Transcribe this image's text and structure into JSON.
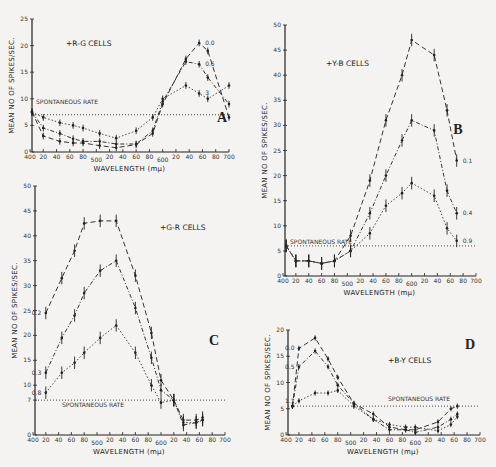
{
  "chart_data": [
    {
      "panel": "A",
      "type": "line",
      "title": "+R-G CELLS",
      "xlabel": "WAVELENGTH (mμ)",
      "ylabel": "MEAN NO OF SPIKES/SEC.",
      "xlim": [
        400,
        700
      ],
      "ylim": [
        0,
        25
      ],
      "yticks": [
        0,
        5,
        10,
        15,
        20,
        25
      ],
      "xtick_labels": [
        "400",
        "20",
        "40",
        "60",
        "80",
        "500",
        "20",
        "40",
        "60",
        "80",
        "600",
        "20",
        "40",
        "60",
        "80",
        "700"
      ],
      "spontaneous_rate": 7,
      "spontaneous_label": "SPONTANEOUS RATE",
      "grid": false,
      "series": [
        {
          "name": "0.0",
          "x": [
            403,
            420,
            445,
            465,
            480,
            505,
            530,
            560,
            585,
            600,
            635,
            655,
            668,
            700
          ],
          "y": [
            7.5,
            3,
            2,
            1.7,
            1.7,
            1.2,
            0.8,
            1.4,
            3.5,
            9,
            17.5,
            20.5,
            19,
            6.5
          ]
        },
        {
          "name": "0.6",
          "x": [
            403,
            420,
            445,
            465,
            480,
            505,
            530,
            560,
            585,
            600,
            635,
            655,
            668,
            700
          ],
          "y": [
            7.5,
            4.5,
            3.5,
            2.5,
            2,
            2,
            1.5,
            1.5,
            4,
            9.5,
            17,
            16.5,
            14,
            9
          ]
        },
        {
          "name": "3",
          "x": [
            403,
            420,
            445,
            465,
            480,
            505,
            530,
            560,
            585,
            600,
            635,
            655,
            668,
            700
          ],
          "y": [
            7.5,
            6.5,
            5.5,
            5,
            4.5,
            3.5,
            2.6,
            4,
            6.5,
            10,
            12.5,
            11,
            10,
            12.5
          ]
        }
      ]
    },
    {
      "panel": "B",
      "type": "line",
      "title": "+Y-B CELLS",
      "xlabel": "WAVELENGTH (mμ)",
      "ylabel": "MEAN NO OF SPIKES/SEC.",
      "xlim": [
        400,
        700
      ],
      "ylim": [
        0,
        50
      ],
      "yticks": [
        0,
        5,
        10,
        15,
        20,
        25,
        30,
        35,
        40,
        45,
        50
      ],
      "xtick_labels": [
        "400",
        "20",
        "40",
        "60",
        "80",
        "500",
        "20",
        "40",
        "60",
        "80",
        "600",
        "20",
        "40",
        "60",
        "80",
        "700"
      ],
      "spontaneous_rate": 6,
      "spontaneous_label": "SPONTANEOUS RATE",
      "grid": false,
      "series": [
        {
          "name": "0.1",
          "x": [
            405,
            420,
            440,
            460,
            480,
            505,
            535,
            560,
            585,
            600,
            635,
            655,
            670
          ],
          "y": [
            6,
            3,
            3,
            2.5,
            3,
            8,
            19,
            31,
            40,
            47,
            44,
            33,
            23
          ]
        },
        {
          "name": "0.4",
          "x": [
            405,
            420,
            440,
            460,
            480,
            505,
            535,
            560,
            585,
            600,
            635,
            655,
            670
          ],
          "y": [
            6,
            3,
            3,
            2.5,
            3,
            5,
            12.5,
            20,
            27,
            31,
            29,
            17,
            12.5
          ]
        },
        {
          "name": "0.9",
          "x": [
            405,
            420,
            440,
            460,
            480,
            505,
            535,
            560,
            585,
            600,
            635,
            655,
            670
          ],
          "y": [
            6,
            3,
            3,
            2.5,
            3,
            5,
            8.5,
            14,
            16.5,
            18.5,
            16,
            9.5,
            7
          ]
        }
      ]
    },
    {
      "panel": "C",
      "type": "line",
      "title": "+G-R CELLS",
      "xlabel": "WAVELENGTH (mμ)",
      "ylabel": "MEAN NO OF SPIKES/SEC.",
      "xlim": [
        400,
        700
      ],
      "ylim": [
        0,
        50
      ],
      "yticks": [
        0,
        7,
        10,
        15,
        20,
        25,
        30,
        35,
        40,
        45,
        50
      ],
      "xtick_labels": [
        "400",
        "20",
        "40",
        "60",
        "80",
        "500",
        "20",
        "40",
        "60",
        "80",
        "600",
        "20",
        "40",
        "60",
        "80",
        "700"
      ],
      "spontaneous_rate": 7,
      "spontaneous_label": "SPONTANEOUS RATE",
      "grid": false,
      "series": [
        {
          "name": "0.2",
          "x": [
            420,
            445,
            465,
            480,
            505,
            530,
            560,
            585,
            600,
            620,
            635,
            655,
            665
          ],
          "y": [
            24.5,
            31.5,
            37,
            42.5,
            43,
            43,
            32,
            20.5,
            11,
            7,
            3,
            3,
            3.5
          ]
        },
        {
          "name": "0.3",
          "x": [
            420,
            445,
            465,
            480,
            505,
            530,
            560,
            585,
            600,
            620,
            635,
            655,
            665
          ],
          "y": [
            12.5,
            19.5,
            24,
            28.5,
            33,
            35,
            25.5,
            15.5,
            9,
            7,
            2,
            2.5,
            3
          ]
        },
        {
          "name": "0.8",
          "x": [
            420,
            445,
            465,
            480,
            505,
            530,
            560,
            585,
            600,
            620,
            635,
            655,
            665
          ],
          "y": [
            8.5,
            12.5,
            14.5,
            16.5,
            19.5,
            22,
            16.5,
            10,
            6.5,
            7,
            2.5,
            2.5,
            3
          ]
        }
      ]
    },
    {
      "panel": "D",
      "type": "line",
      "title": "+B-Y CELLS",
      "xlabel": "WAVELENGTH (mμ)",
      "ylabel": "MEAN NO OF SPIKES/SEC.",
      "xlim": [
        400,
        700
      ],
      "ylim": [
        0,
        20
      ],
      "yticks": [
        0,
        5,
        10,
        15,
        20
      ],
      "xtick_labels": [
        "400",
        "20",
        "40",
        "60",
        "80",
        "500",
        "20",
        "40",
        "60",
        "80",
        "600",
        "20",
        "40",
        "60",
        "80",
        "700"
      ],
      "spontaneous_rate": 5.5,
      "spontaneous_label": "SPONTANEOUS RATE",
      "grid": false,
      "series": [
        {
          "name": "0.0",
          "x": [
            410,
            420,
            445,
            465,
            480,
            505,
            535,
            560,
            585,
            600,
            635,
            655,
            665
          ],
          "y": [
            5.5,
            16.5,
            18.5,
            14.5,
            11,
            6,
            4,
            1.5,
            1,
            1,
            2.5,
            5,
            5.5
          ]
        },
        {
          "name": "0.5",
          "x": [
            410,
            420,
            445,
            465,
            480,
            505,
            535,
            560,
            585,
            600,
            635,
            655,
            665
          ],
          "y": [
            5.5,
            13,
            16,
            13,
            9.5,
            6,
            3,
            1,
            1,
            0.5,
            1.5,
            3,
            4
          ]
        },
        {
          "name": "1.1",
          "x": [
            410,
            420,
            445,
            465,
            480,
            505,
            535,
            560,
            585,
            600,
            635,
            655,
            665
          ],
          "y": [
            5.5,
            6.5,
            8,
            8,
            8.5,
            5.5,
            3,
            2,
            1.5,
            1.5,
            0.8,
            2,
            3.5
          ]
        }
      ]
    }
  ]
}
